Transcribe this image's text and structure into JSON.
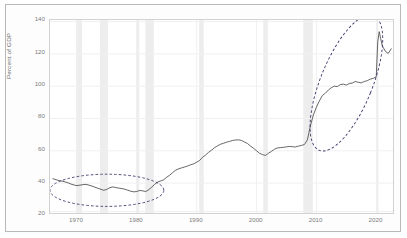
{
  "chart_data": {
    "type": "line",
    "title": "",
    "xlabel": "",
    "ylabel": "Percent of GDP",
    "xlim": [
      1965.5,
      2022.8
    ],
    "ylim": [
      18,
      142
    ],
    "yticks": [
      20,
      40,
      60,
      80,
      100,
      120,
      140
    ],
    "xticks": [
      1970,
      1980,
      1990,
      2000,
      2010,
      2020
    ],
    "grid": true,
    "legend": "none",
    "line_color": "#4c4c4c",
    "recession_band_color": "#ededed",
    "gridline_color": "#f0f0f0",
    "annotation_color": "#3a3a6e",
    "recessions": [
      {
        "start": 1969.92,
        "end": 1970.92
      },
      {
        "start": 1973.92,
        "end": 1975.25
      },
      {
        "start": 1980.0,
        "end": 1980.5
      },
      {
        "start": 1981.5,
        "end": 1982.92
      },
      {
        "start": 1990.5,
        "end": 1991.25
      },
      {
        "start": 2001.17,
        "end": 2001.92
      },
      {
        "start": 2007.92,
        "end": 2009.5
      },
      {
        "start": 2020.08,
        "end": 2020.42
      }
    ],
    "annotations": [
      {
        "name": "low-debt-era-ellipse",
        "shape": "dashed-ellipse",
        "cx": 1975.0,
        "cy": 32.0,
        "rx": 9.5,
        "ry": 10.0,
        "rotation": 0,
        "label": ""
      },
      {
        "name": "debt-surge-ellipse",
        "shape": "dashed-ellipse",
        "cx": 2015.0,
        "cy": 98.0,
        "rx": 11.5,
        "ry": 45.0,
        "rotation": 22,
        "label": ""
      }
    ],
    "x": [
      1966.0,
      1966.5,
      1967.0,
      1967.5,
      1968.0,
      1968.5,
      1969.0,
      1969.5,
      1970.0,
      1970.5,
      1971.0,
      1971.5,
      1972.0,
      1972.5,
      1973.0,
      1973.5,
      1974.0,
      1974.5,
      1975.0,
      1975.5,
      1976.0,
      1976.5,
      1977.0,
      1977.5,
      1978.0,
      1978.5,
      1979.0,
      1979.5,
      1980.0,
      1980.5,
      1981.0,
      1981.5,
      1982.0,
      1982.5,
      1983.0,
      1983.5,
      1984.0,
      1984.5,
      1985.0,
      1985.5,
      1986.0,
      1986.5,
      1987.0,
      1987.5,
      1988.0,
      1988.5,
      1989.0,
      1989.5,
      1990.0,
      1990.5,
      1991.0,
      1991.5,
      1992.0,
      1992.5,
      1993.0,
      1993.5,
      1994.0,
      1994.5,
      1995.0,
      1995.5,
      1996.0,
      1996.5,
      1997.0,
      1997.5,
      1998.0,
      1998.5,
      1999.0,
      1999.5,
      2000.0,
      2000.5,
      2001.0,
      2001.5,
      2002.0,
      2002.5,
      2003.0,
      2003.5,
      2004.0,
      2004.5,
      2005.0,
      2005.5,
      2006.0,
      2006.5,
      2007.0,
      2007.5,
      2008.0,
      2008.5,
      2009.0,
      2009.5,
      2010.0,
      2010.5,
      2011.0,
      2011.5,
      2012.0,
      2012.5,
      2013.0,
      2013.5,
      2014.0,
      2014.5,
      2015.0,
      2015.5,
      2016.0,
      2016.5,
      2017.0,
      2017.5,
      2018.0,
      2018.5,
      2019.0,
      2019.5,
      2020.0,
      2020.25,
      2020.5,
      2020.75,
      2021.0,
      2021.5,
      2022.0,
      2022.5
    ],
    "values": [
      40.0,
      39.4,
      38.8,
      38.5,
      38.0,
      37.4,
      36.6,
      36.0,
      35.6,
      35.9,
      36.2,
      36.4,
      35.9,
      35.3,
      34.6,
      33.9,
      33.2,
      32.6,
      33.2,
      34.3,
      34.8,
      34.3,
      34.0,
      33.7,
      33.3,
      32.6,
      32.0,
      31.6,
      31.8,
      32.5,
      32.2,
      31.8,
      33.0,
      34.6,
      36.5,
      37.9,
      38.6,
      39.4,
      41.0,
      42.3,
      44.0,
      45.5,
      46.4,
      47.0,
      47.6,
      48.2,
      49.0,
      49.6,
      50.6,
      51.8,
      53.8,
      55.3,
      57.0,
      58.4,
      60.0,
      61.2,
      62.2,
      62.8,
      63.5,
      64.0,
      64.6,
      64.9,
      65.0,
      64.6,
      63.6,
      62.6,
      61.0,
      59.6,
      58.0,
      56.4,
      55.5,
      55.0,
      56.4,
      57.6,
      59.0,
      59.8,
      60.0,
      60.2,
      60.5,
      60.8,
      60.6,
      60.4,
      61.0,
      61.4,
      62.0,
      65.0,
      74.0,
      81.0,
      86.0,
      90.0,
      93.5,
      95.0,
      97.0,
      98.5,
      99.5,
      99.2,
      100.5,
      100.8,
      100.2,
      101.2,
      101.5,
      102.5,
      102.0,
      101.6,
      102.5,
      103.0,
      104.0,
      104.5,
      105.5,
      128.0,
      134.5,
      130.0,
      125.5,
      122.0,
      120.5,
      123.5
    ]
  },
  "axis": {
    "ylabel": "Percent of GDP",
    "yticks": [
      "140",
      "120",
      "100",
      "80",
      "60",
      "40",
      "20"
    ],
    "xticks": [
      "1970",
      "1980",
      "1990",
      "2000",
      "2010",
      "2020"
    ]
  }
}
